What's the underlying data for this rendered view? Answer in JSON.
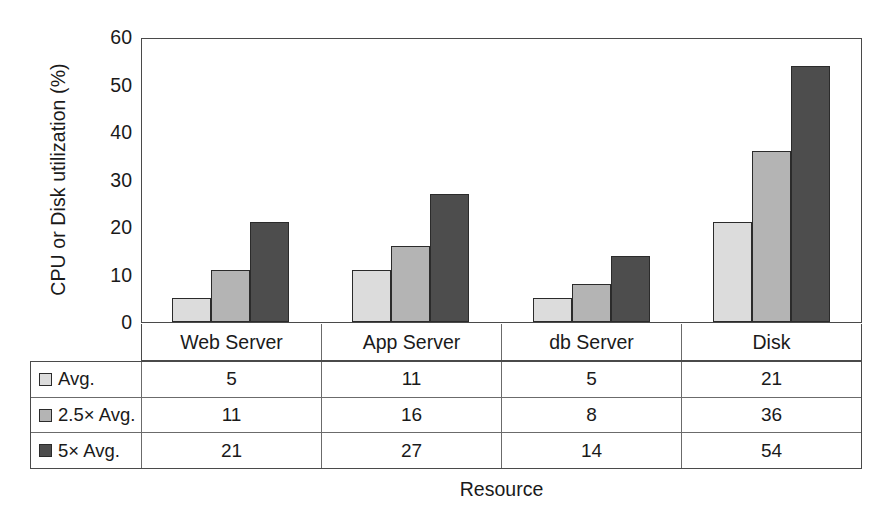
{
  "chart_data": {
    "type": "bar",
    "title": "",
    "xlabel": "Resource",
    "ylabel": "CPU or Disk utilization (%)",
    "categories": [
      "Web Server",
      "App Server",
      "db Server",
      "Disk"
    ],
    "series": [
      {
        "name": "Avg.",
        "values": [
          5,
          11,
          5,
          21
        ],
        "color": "#dcdcdc"
      },
      {
        "name": "2.5× Avg.",
        "values": [
          11,
          16,
          8,
          36
        ],
        "color": "#b4b4b4"
      },
      {
        "name": "5× Avg.",
        "values": [
          21,
          27,
          14,
          54
        ],
        "color": "#4d4d4d"
      }
    ],
    "ylim": [
      0,
      60
    ],
    "yticks": [
      0,
      10,
      20,
      30,
      40,
      50,
      60
    ],
    "ytick_labels": [
      "0",
      "10",
      "20",
      "30",
      "40",
      "50",
      "60"
    ],
    "grid": false,
    "legend_position": "data-table-left-column",
    "data_table_visible": true
  },
  "axes": {
    "y_title": "CPU or Disk utilization (%)",
    "x_title": "Resource"
  },
  "table": {
    "column_headers": [
      "Web Server",
      "App Server",
      "db Server",
      "Disk"
    ],
    "rows": [
      {
        "label": "Avg.",
        "swatch": "legend-swatch-avg",
        "values": [
          "5",
          "11",
          "5",
          "21"
        ]
      },
      {
        "label": "2.5× Avg.",
        "swatch": "legend-swatch-2-5x-avg",
        "values": [
          "11",
          "16",
          "8",
          "36"
        ]
      },
      {
        "label": "5× Avg.",
        "swatch": "legend-swatch-5x-avg",
        "values": [
          "21",
          "27",
          "14",
          "54"
        ]
      }
    ]
  },
  "colors": {
    "series_avg": "#dcdcdc",
    "series_2_5x": "#b4b4b4",
    "series_5x": "#4d4d4d",
    "axis_line": "#4a4a4a",
    "bar_outline": "#2b2b2b",
    "background": "#ffffff",
    "text": "#1a1a1a"
  }
}
